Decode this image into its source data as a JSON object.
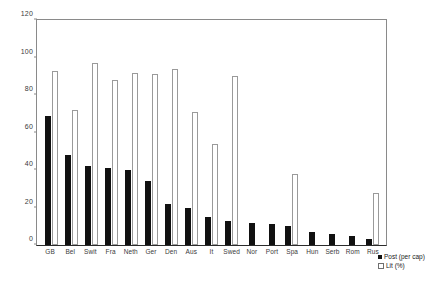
{
  "chart_data": {
    "type": "bar",
    "title": "",
    "xlabel": "",
    "ylabel": "",
    "ylim": [
      0,
      120
    ],
    "yticks": [
      0,
      20,
      40,
      60,
      80,
      100,
      120
    ],
    "grid": false,
    "legend_position": "bottom-right",
    "categories": [
      "GB",
      "Bel",
      "Swit",
      "Fra",
      "Neth",
      "Ger",
      "Den",
      "Aus",
      "It",
      "Swed",
      "Nor",
      "Port",
      "Spa",
      "Hun",
      "Serb",
      "Rom",
      "Rus"
    ],
    "series": [
      {
        "name": "Post (per cap)",
        "color": "#111111",
        "values": [
          69,
          48,
          42,
          41,
          40,
          34,
          22,
          20,
          15,
          13,
          12,
          11,
          10,
          7,
          6,
          5,
          3
        ]
      },
      {
        "name": "Lit (%)",
        "color": "#ffffff",
        "values": [
          93,
          72,
          97,
          88,
          92,
          91,
          94,
          71,
          54,
          90,
          0,
          0,
          38,
          0,
          0,
          0,
          28
        ]
      }
    ]
  },
  "legend": {
    "items": [
      {
        "label": "Post (per cap)",
        "marker": "filled-square"
      },
      {
        "label": "Lit (%)",
        "marker": "open-square"
      }
    ]
  }
}
